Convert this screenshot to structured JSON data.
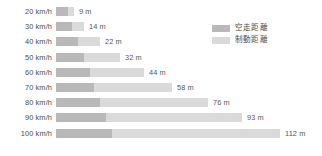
{
  "chart_data": {
    "type": "bar",
    "title": "",
    "subtitle": "",
    "xlabel": "",
    "ylabel": "",
    "orientation": "horizontal",
    "stacked": true,
    "grid": false,
    "legend_position": "top-right",
    "unit": "m",
    "axis_start_px": 56,
    "px_per_meter": 2.0,
    "xlim": [
      0,
      112
    ],
    "categories": [
      "20 km/h",
      "30 km/h",
      "40 km/h",
      "50 km/h",
      "60 km/h",
      "70 km/h",
      "80 km/h",
      "90 km/h",
      "100 km/h"
    ],
    "series": [
      {
        "name": "空走距離",
        "color": "#b9b9b9",
        "values": [
          6,
          8,
          11,
          14,
          17,
          19,
          22,
          25,
          28
        ]
      },
      {
        "name": "制動距離",
        "color": "#dadada",
        "values": [
          3,
          6,
          11,
          18,
          27,
          39,
          54,
          68,
          84
        ]
      }
    ],
    "totals": [
      9,
      14,
      22,
      32,
      44,
      58,
      76,
      93,
      112
    ],
    "total_labels": [
      "9 m",
      "14 m",
      "22 m",
      "32 m",
      "44 m",
      "58 m",
      "76 m",
      "93 m",
      "112 m"
    ],
    "rows": [
      {
        "category": "20 km/h",
        "reaction": 6,
        "braking": 3,
        "total": 9,
        "total_label": "9 m"
      },
      {
        "category": "30 km/h",
        "reaction": 8,
        "braking": 6,
        "total": 14,
        "total_label": "14 m"
      },
      {
        "category": "40 km/h",
        "reaction": 11,
        "braking": 11,
        "total": 22,
        "total_label": "22 m"
      },
      {
        "category": "50 km/h",
        "reaction": 14,
        "braking": 18,
        "total": 32,
        "total_label": "32 m"
      },
      {
        "category": "60 km/h",
        "reaction": 17,
        "braking": 27,
        "total": 44,
        "total_label": "44 m"
      },
      {
        "category": "70 km/h",
        "reaction": 19,
        "braking": 39,
        "total": 58,
        "total_label": "58 m"
      },
      {
        "category": "80 km/h",
        "reaction": 22,
        "braking": 54,
        "total": 76,
        "total_label": "76 m"
      },
      {
        "category": "90 km/h",
        "reaction": 25,
        "braking": 68,
        "total": 93,
        "total_label": "93 m"
      },
      {
        "category": "100 km/h",
        "reaction": 28,
        "braking": 84,
        "total": 112,
        "total_label": "112 m"
      }
    ]
  },
  "legend": {
    "items": [
      {
        "label": "空走距離",
        "color": "#b9b9b9"
      },
      {
        "label": "制動距離",
        "color": "#dadada"
      }
    ]
  },
  "colors": {
    "background": "#ffffff",
    "reaction": "#b9b9b9",
    "braking": "#dadada",
    "category_text": "#4d4d4d",
    "value_text": "#565656"
  }
}
